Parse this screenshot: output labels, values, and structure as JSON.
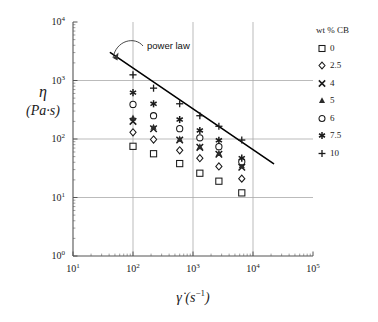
{
  "axes": {
    "y_label_symbol": "η",
    "y_label_units": "(Pa·s)",
    "x_label_symbol": "γ̇",
    "x_label_units": "(s",
    "x_label_units_exp": "−1",
    "x_label_units_close": ")",
    "y_ticks": [
      "10",
      "10",
      "10",
      "10",
      "10"
    ],
    "y_tick_exps": [
      "4",
      "3",
      "2",
      "1",
      "0"
    ],
    "x_ticks": [
      "10",
      "10",
      "10",
      "10",
      "10"
    ],
    "x_tick_exps": [
      "1",
      "2",
      "3",
      "4",
      "5"
    ]
  },
  "annotation": {
    "power_law": "power law"
  },
  "legend": {
    "title": "wt % CB",
    "items": [
      {
        "label": "0",
        "symbol": "square-open"
      },
      {
        "label": "2.5",
        "symbol": "diamond-open"
      },
      {
        "label": "4",
        "symbol": "cross-x"
      },
      {
        "label": "5",
        "symbol": "triangle-filled"
      },
      {
        "label": "6",
        "symbol": "circle-open"
      },
      {
        "label": "7.5",
        "symbol": "asterisk"
      },
      {
        "label": "10",
        "symbol": "plus"
      }
    ]
  },
  "chart_data": {
    "type": "scatter",
    "title": "",
    "xlabel": "γ̇ (s⁻¹)",
    "ylabel": "η (Pa·s)",
    "xscale": "log",
    "yscale": "log",
    "xlim": [
      10,
      100000
    ],
    "ylim": [
      1,
      10000
    ],
    "grid": true,
    "legend_position": "right",
    "legend_title": "wt % CB",
    "x": [
      100,
      220,
      600,
      1300,
      2700,
      6500
    ],
    "series": [
      {
        "name": "0",
        "marker": "square-open",
        "values": [
          75,
          56,
          38,
          26,
          19,
          12
        ]
      },
      {
        "name": "2.5",
        "marker": "diamond-open",
        "values": [
          130,
          98,
          64,
          47,
          34,
          21
        ]
      },
      {
        "name": "4",
        "marker": "cross-x",
        "values": [
          200,
          150,
          96,
          72,
          55,
          33
        ]
      },
      {
        "name": "5",
        "marker": "triangle-filled",
        "values": [
          230,
          160,
          100,
          74,
          57,
          35
        ]
      },
      {
        "name": "6",
        "marker": "circle-open",
        "values": [
          390,
          250,
          150,
          105,
          74,
          41
        ]
      },
      {
        "name": "7.5",
        "marker": "asterisk",
        "values": [
          620,
          400,
          215,
          140,
          95,
          47
        ]
      },
      {
        "name": "10",
        "marker": "plus",
        "values": [
          1250,
          740,
          400,
          250,
          165,
          96
        ]
      }
    ],
    "power_law_line": {
      "label": "power law",
      "x_start": 42,
      "y_start": 3000,
      "x_end": 22000,
      "y_end": 38
    }
  }
}
